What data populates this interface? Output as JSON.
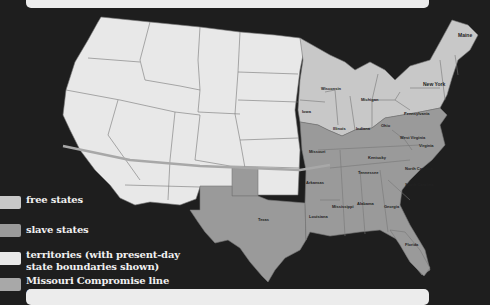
{
  "map": {
    "title": "United States: free states, slave states, and territories with the Missouri Compromise line",
    "colors": {
      "free_states": "#c8c8c8",
      "slave_states": "#9a9a9a",
      "territories": "#e8e8e8",
      "compromise_line": "#a8a8a8",
      "water": "#1e1e1e",
      "border": "#777777"
    },
    "state_labels": {
      "maine": "Maine",
      "new_york": "New York",
      "pennsylvania": "Pennsylvania",
      "wisconsin": "Wisconsin",
      "michigan": "Michigan",
      "iowa": "Iowa",
      "illinois": "Illinois",
      "indiana": "Indiana",
      "ohio": "Ohio",
      "missouri": "Missouri",
      "kentucky": "Kentucky",
      "west_virginia": "West Virginia",
      "virginia": "Virginia",
      "tennessee": "Tennessee",
      "north_carolina": "North Carolina",
      "south_carolina": "South Carolina",
      "arkansas": "Arkansas",
      "mississippi": "Mississippi",
      "alabama": "Alabama",
      "georgia": "Georgia",
      "louisiana": "Louisiana",
      "texas": "Texas",
      "florida": "Florida"
    }
  },
  "legend": {
    "items": [
      {
        "label": "free states",
        "color": "#c8c8c8"
      },
      {
        "label": "slave states",
        "color": "#9a9a9a"
      },
      {
        "label_line1": "territories (with present-day",
        "label_line2": "state boundaries shown)",
        "color": "#e8e8e8"
      },
      {
        "label_line1": "Missouri Compromise line",
        "label_line2": "(36°30' parallel)",
        "color": "#a8a8a8"
      }
    ]
  }
}
